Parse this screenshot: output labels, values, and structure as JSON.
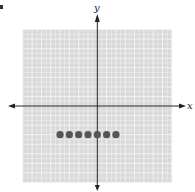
{
  "chart_data": {
    "type": "scatter",
    "title": "",
    "xlabel": "x",
    "ylabel": "y",
    "xlim": [
      -8,
      8
    ],
    "ylim": [
      -8,
      8
    ],
    "grid": true,
    "grid_minor_step": 0.5,
    "grid_major_step": 1,
    "series": [
      {
        "name": "points",
        "points": [
          {
            "x": -4,
            "y": -3
          },
          {
            "x": -3,
            "y": -3
          },
          {
            "x": -2,
            "y": -3
          },
          {
            "x": -1,
            "y": -3
          },
          {
            "x": 0,
            "y": -3
          },
          {
            "x": 1,
            "y": -3
          },
          {
            "x": 2,
            "y": -3
          }
        ]
      }
    ]
  },
  "colors": {
    "grid_background": "#d9d9d9",
    "grid_lines": "#f2f2f2",
    "axis": "#222222",
    "points": "#555555"
  }
}
